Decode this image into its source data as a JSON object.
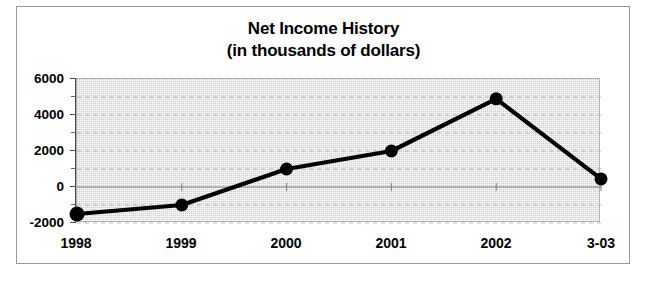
{
  "chart_data": {
    "type": "line",
    "title": "Net Income History",
    "subtitle": "(in thousands of dollars)",
    "title_lines": [
      "Net Income History",
      "(in thousands of dollars)"
    ],
    "xlabel": "",
    "ylabel": "",
    "categories": [
      "1998",
      "1999",
      "2000",
      "2001",
      "2002",
      "3-03"
    ],
    "values": [
      -1500,
      -1000,
      1000,
      2000,
      4900,
      450
    ],
    "series": [
      {
        "name": "Net Income",
        "values": [
          -1500,
          -1000,
          1000,
          2000,
          4900,
          450
        ]
      }
    ],
    "ylim": [
      -2000,
      6000
    ],
    "ytick_labels": [
      "6000",
      "4000",
      "2000",
      "0",
      "-2000"
    ],
    "ytick_values": [
      6000,
      4000,
      2000,
      0,
      -2000
    ],
    "yminor_values": [
      5000,
      3000,
      1000,
      -1000
    ],
    "grid": true,
    "grid_style": "dashed-horizontal",
    "legend": "none",
    "marker": "filled-circle",
    "line_color": "#000000",
    "marker_color": "#000000",
    "plot_background": "#f2f2f2",
    "grid_color": "#b9b9b9",
    "axis_color": "#4a4a4a"
  },
  "figure": {
    "border_color": "#9a9a9a",
    "background": "#ffffff"
  }
}
